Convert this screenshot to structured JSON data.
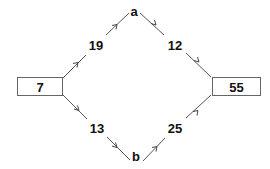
{
  "diagram": {
    "type": "directed-graph",
    "nodes": [
      {
        "id": "source",
        "label": "7",
        "shape": "box"
      },
      {
        "id": "a",
        "label": "a",
        "shape": "text"
      },
      {
        "id": "b",
        "label": "b",
        "shape": "text"
      },
      {
        "id": "sink",
        "label": "55",
        "shape": "box"
      }
    ],
    "edges": [
      {
        "from": "7",
        "to": "a",
        "label": "19"
      },
      {
        "from": "a",
        "to": "55",
        "label": "12"
      },
      {
        "from": "7",
        "to": "b",
        "label": "13"
      },
      {
        "from": "b",
        "to": "55",
        "label": "25"
      }
    ],
    "colors": {
      "line": "#555555",
      "box_border": "#666666",
      "text": "#111111",
      "background": "#ffffff"
    }
  }
}
